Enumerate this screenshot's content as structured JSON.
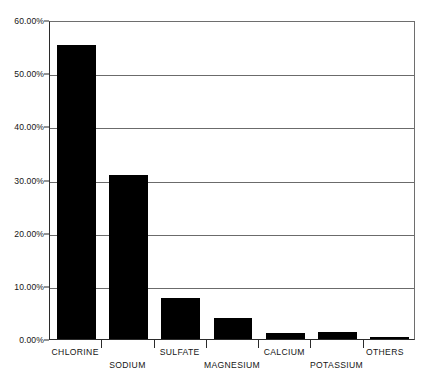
{
  "chart_data": {
    "type": "bar",
    "title": "",
    "subtitle": "",
    "xlabel": "",
    "ylabel": "",
    "categories": [
      "CHLORINE",
      "SODIUM",
      "SULFATE",
      "MAGNESIUM",
      "CALCIUM",
      "POTASSIUM",
      "OTHERS"
    ],
    "values": [
      55.3,
      30.9,
      7.8,
      3.9,
      1.2,
      1.3,
      0.3
    ],
    "value_labels": [
      "55.30%",
      "30.90%",
      "7.80%",
      "3.90%",
      "1.20%",
      "1.30%",
      "0.30%"
    ],
    "series": [
      {
        "name": "Composition of dissolved salts in seawater",
        "values": [
          55.3,
          30.9,
          7.8,
          3.9,
          1.2,
          1.3,
          0.3
        ]
      }
    ],
    "ylim": [
      0,
      60
    ],
    "ytick_values": [
      0,
      10,
      20,
      30,
      40,
      50,
      60
    ],
    "ytick_labels": [
      "0.00%",
      "10.00%",
      "20.00%",
      "30.00%",
      "40.00%",
      "50.00%",
      "60.00%"
    ],
    "grid": true,
    "grid_axis": "y",
    "legend": false,
    "legend_position": "none",
    "bar_color": "#000000",
    "axis_color": "#2b2b2b",
    "grid_color": "#6b6b6b",
    "background_color": "#ffffff",
    "label_rows": [
      0,
      1,
      0,
      1,
      0,
      1,
      0
    ]
  }
}
